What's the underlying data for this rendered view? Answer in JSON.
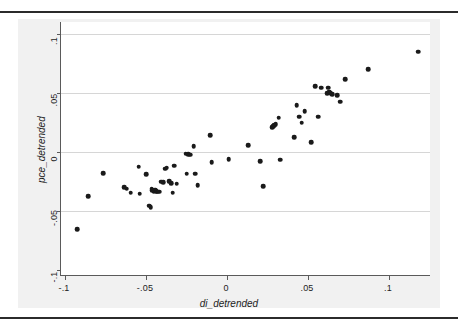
{
  "figure": {
    "kind": "scatter-plot",
    "background_color": "#f1f1f1",
    "plot_background_color": "#ffffff",
    "marker_color": "#1a1a1a",
    "gridline_color": "#d6d6d6",
    "axis_color": "#5a5a5a"
  },
  "chart_data": {
    "type": "scatter",
    "title": "",
    "subtitle": "",
    "xlabel": "di_detrended",
    "ylabel": "pce_detrended",
    "xlim": [
      -0.105,
      0.125
    ],
    "ylim": [
      -0.108,
      0.105
    ],
    "xticks": [
      -0.1,
      -0.05,
      0,
      0.05,
      0.1
    ],
    "xtick_labels": [
      "-.1",
      "-.05",
      "0",
      ".05",
      ".1"
    ],
    "yticks": [
      -0.1,
      -0.05,
      0,
      0.05,
      0.1
    ],
    "ytick_labels": [
      "-.1",
      "-.05",
      "0",
      ".05",
      ".1"
    ],
    "grid": "horizontal",
    "legend": "none",
    "n_points": 78,
    "series": [
      {
        "name": "pce_detrended vs di_detrended",
        "marker": "filled-circle",
        "color": "#1a1a1a",
        "points": [
          [
            -0.0925,
            -0.0655
          ],
          [
            -0.0855,
            -0.0375
          ],
          [
            -0.0765,
            -0.018
          ],
          [
            -0.0635,
            -0.03
          ],
          [
            -0.062,
            -0.031
          ],
          [
            -0.0595,
            -0.0345
          ],
          [
            -0.0545,
            -0.0125
          ],
          [
            -0.054,
            -0.0355
          ],
          [
            -0.05,
            -0.019
          ],
          [
            -0.048,
            -0.0455
          ],
          [
            -0.0472,
            -0.047
          ],
          [
            -0.0465,
            -0.031
          ],
          [
            -0.046,
            -0.0325
          ],
          [
            -0.0452,
            -0.033
          ],
          [
            -0.0445,
            -0.032
          ],
          [
            -0.0438,
            -0.033
          ],
          [
            -0.043,
            -0.0335
          ],
          [
            -0.042,
            -0.0335
          ],
          [
            -0.0405,
            -0.025
          ],
          [
            -0.0395,
            -0.0255
          ],
          [
            -0.038,
            -0.014
          ],
          [
            -0.0372,
            -0.0132
          ],
          [
            -0.0355,
            -0.0245
          ],
          [
            -0.0345,
            -0.0265
          ],
          [
            -0.0335,
            -0.0345
          ],
          [
            -0.0325,
            -0.0115
          ],
          [
            -0.031,
            -0.027
          ],
          [
            -0.0255,
            -0.0015
          ],
          [
            -0.025,
            -0.0185
          ],
          [
            -0.024,
            -0.002
          ],
          [
            -0.0228,
            -0.0022
          ],
          [
            -0.0205,
            0.0048
          ],
          [
            -0.0195,
            -0.0185
          ],
          [
            -0.018,
            -0.028
          ],
          [
            -0.0105,
            0.014
          ],
          [
            -0.0095,
            -0.0085
          ],
          [
            0.001,
            -0.006
          ],
          [
            0.013,
            0.006
          ],
          [
            0.0205,
            -0.008
          ],
          [
            0.0225,
            -0.029
          ],
          [
            0.028,
            0.021
          ],
          [
            0.0285,
            0.0218
          ],
          [
            0.0292,
            0.0228
          ],
          [
            0.03,
            0.0238
          ],
          [
            0.032,
            0.029
          ],
          [
            0.033,
            -0.0065
          ],
          [
            0.0415,
            0.0125
          ],
          [
            0.043,
            0.0395
          ],
          [
            0.0445,
            0.03
          ],
          [
            0.0462,
            0.0248
          ],
          [
            0.048,
            0.0345
          ],
          [
            0.052,
            0.0085
          ],
          [
            0.0545,
            0.056
          ],
          [
            0.0562,
            0.03
          ],
          [
            0.058,
            0.0545
          ],
          [
            0.062,
            0.05
          ],
          [
            0.0625,
            0.0545
          ],
          [
            0.063,
            0.0512
          ],
          [
            0.064,
            0.05
          ],
          [
            0.0648,
            0.0492
          ],
          [
            0.068,
            0.048
          ],
          [
            0.07,
            0.0425
          ],
          [
            0.073,
            0.0615
          ],
          [
            0.087,
            0.07
          ],
          [
            0.118,
            0.085
          ]
        ]
      }
    ]
  },
  "labels": {
    "x_axis_title": "di_detrended",
    "y_axis_title": "pce_detrended"
  }
}
